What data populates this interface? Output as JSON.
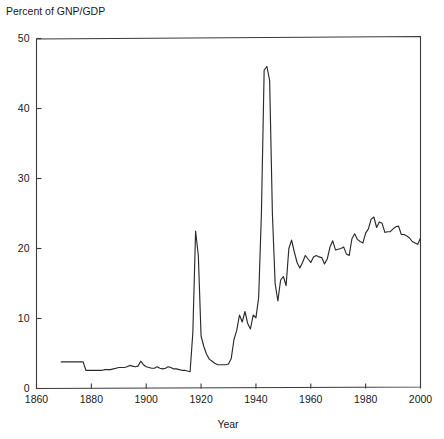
{
  "chart_data": {
    "type": "line",
    "title": "",
    "ylabel": "Percent of GNP/GDP",
    "xlabel": "Year",
    "xlim": [
      1860,
      2000
    ],
    "ylim": [
      0,
      50
    ],
    "xticks": [
      1860,
      1880,
      1900,
      1920,
      1940,
      1960,
      1980,
      2000
    ],
    "xtick_labels": [
      "1860",
      "1880",
      "1900",
      "1920",
      "1940",
      "1960",
      "1980",
      "2000"
    ],
    "yticks": [
      0,
      10,
      20,
      30,
      40,
      50
    ],
    "ytick_labels": [
      "0",
      "10",
      "20",
      "30",
      "40",
      "50"
    ],
    "grid": false,
    "legend": null,
    "series": [
      {
        "name": "Federal outlays as percent of GNP/GDP",
        "color": "#2b2b2b",
        "x": [
          1869,
          1870,
          1871,
          1872,
          1873,
          1874,
          1875,
          1876,
          1877,
          1878,
          1879,
          1880,
          1881,
          1882,
          1883,
          1884,
          1885,
          1886,
          1887,
          1888,
          1889,
          1890,
          1891,
          1892,
          1893,
          1894,
          1895,
          1896,
          1897,
          1898,
          1899,
          1900,
          1901,
          1902,
          1903,
          1904,
          1905,
          1906,
          1907,
          1908,
          1909,
          1910,
          1911,
          1912,
          1913,
          1914,
          1915,
          1916,
          1917,
          1918,
          1919,
          1920,
          1921,
          1922,
          1923,
          1924,
          1925,
          1926,
          1927,
          1928,
          1929,
          1930,
          1931,
          1932,
          1933,
          1934,
          1935,
          1936,
          1937,
          1938,
          1939,
          1940,
          1941,
          1942,
          1943,
          1944,
          1945,
          1946,
          1947,
          1948,
          1949,
          1950,
          1951,
          1952,
          1953,
          1954,
          1955,
          1956,
          1957,
          1958,
          1959,
          1960,
          1961,
          1962,
          1963,
          1964,
          1965,
          1966,
          1967,
          1968,
          1969,
          1970,
          1971,
          1972,
          1973,
          1974,
          1975,
          1976,
          1977,
          1978,
          1979,
          1980,
          1981,
          1982,
          1983,
          1984,
          1985,
          1986,
          1987,
          1988,
          1989,
          1990,
          1991,
          1992,
          1993,
          1994,
          1995,
          1996,
          1997,
          1998,
          1999,
          2000
        ],
        "y": [
          3.8,
          3.8,
          3.8,
          3.8,
          3.8,
          3.8,
          3.8,
          3.8,
          3.8,
          2.6,
          2.6,
          2.6,
          2.6,
          2.6,
          2.6,
          2.6,
          2.7,
          2.7,
          2.7,
          2.8,
          2.9,
          3.0,
          3.0,
          3.0,
          3.1,
          3.3,
          3.2,
          3.1,
          3.2,
          3.9,
          3.4,
          3.1,
          3.0,
          2.9,
          2.9,
          3.1,
          2.9,
          2.8,
          2.9,
          3.1,
          3.0,
          2.8,
          2.8,
          2.7,
          2.6,
          2.6,
          2.5,
          2.4,
          8.0,
          22.5,
          19.0,
          7.5,
          6.0,
          4.9,
          4.2,
          3.9,
          3.6,
          3.4,
          3.4,
          3.4,
          3.4,
          3.5,
          4.3,
          7.0,
          8.3,
          10.5,
          9.5,
          11.0,
          9.3,
          8.5,
          10.5,
          10.1,
          13.0,
          25.0,
          45.5,
          46.0,
          44.0,
          25.0,
          15.0,
          12.5,
          15.5,
          16.0,
          14.7,
          20.0,
          21.2,
          19.5,
          18.0,
          17.2,
          18.0,
          19.0,
          18.5,
          18.0,
          18.8,
          19.0,
          18.8,
          18.7,
          17.8,
          18.5,
          20.2,
          21.1,
          19.8,
          19.9,
          20.0,
          20.2,
          19.2,
          19.0,
          21.4,
          22.1,
          21.3,
          21.0,
          20.8,
          22.2,
          22.8,
          24.2,
          24.5,
          23.0,
          23.8,
          23.6,
          22.3,
          22.4,
          22.4,
          22.8,
          23.1,
          23.2,
          22.0,
          22.0,
          21.8,
          21.5,
          21.0,
          20.8,
          20.6,
          21.5
        ]
      }
    ]
  },
  "axes": {
    "ylabel": "Percent of GNP/GDP",
    "xlabel": "Year"
  }
}
